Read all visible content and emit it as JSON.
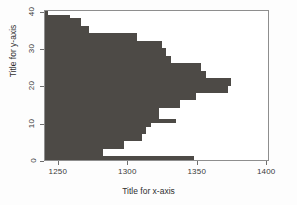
{
  "chart_data": {
    "type": "bar",
    "orientation": "horizontal",
    "title": "",
    "xlabel": "Title for x-axis",
    "ylabel": "Title for y-axis",
    "xlim": [
      1240,
      1402
    ],
    "ylim": [
      0,
      40.5
    ],
    "xticks": [
      1250,
      1300,
      1350,
      1400
    ],
    "yticks": [
      0,
      10,
      20,
      30,
      40
    ],
    "grid": false,
    "legend": null,
    "bar_color": "#4d4a46",
    "baseline": 1240,
    "categories": [
      1,
      2,
      3,
      4,
      5,
      6,
      7,
      8,
      9,
      10,
      11,
      12,
      13,
      14,
      15,
      16,
      17,
      18,
      19,
      20,
      21,
      22,
      23,
      24,
      25,
      26,
      27,
      28,
      29,
      30,
      31,
      32,
      33,
      34,
      35,
      36,
      37,
      38,
      39,
      40
    ],
    "values": [
      1347,
      1282,
      1282,
      1297,
      1297,
      1310,
      1310,
      1313,
      1313,
      1316,
      1334,
      1322,
      1322,
      1322,
      1337,
      1337,
      1349,
      1349,
      1372,
      1372,
      1374,
      1374,
      1356,
      1356,
      1352,
      1352,
      1331,
      1331,
      1327,
      1327,
      1324,
      1324,
      1306,
      1306,
      1272,
      1272,
      1266,
      1266,
      1258,
      1242
    ]
  },
  "axes": {
    "x": {
      "title": "Title for x-axis",
      "tick_labels": [
        "1250",
        "1300",
        "1350",
        "1400"
      ]
    },
    "y": {
      "title": "Title for y-axis",
      "tick_labels": [
        "0",
        "10",
        "20",
        "30",
        "40"
      ]
    }
  }
}
